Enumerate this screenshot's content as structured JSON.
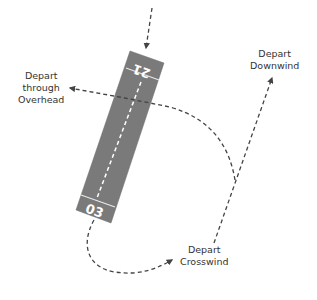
{
  "diagram": {
    "runway": {
      "label_top": "21",
      "label_bottom": "03",
      "fill_color": "#7a7a7a",
      "stripe_color": "#ffffff"
    },
    "path_color": "#444444",
    "labels": {
      "overhead": [
        "Depart",
        "through",
        "Overhead"
      ],
      "downwind": [
        "Depart",
        "Downwind"
      ],
      "crosswind": [
        "Depart",
        "Crosswind"
      ]
    }
  }
}
